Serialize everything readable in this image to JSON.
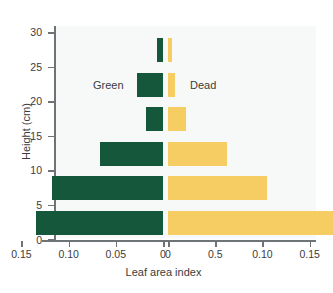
{
  "chart_data": {
    "type": "bar",
    "orientation": "horizontal",
    "layout": "back-to-back population pyramid",
    "title": "",
    "xlabel": "Leaf area index",
    "ylabel": "Height (cm)",
    "categories": [
      "0-5",
      "5-10",
      "10-15",
      "15-20",
      "20-25",
      "25-30"
    ],
    "band_centers": [
      2.5,
      7.5,
      12.5,
      17.5,
      22.5,
      27.5
    ],
    "ylim": [
      0,
      31
    ],
    "ytick_labels": [
      "0",
      "5",
      "10",
      "15",
      "20",
      "25",
      "30"
    ],
    "ytick_values": [
      0,
      5,
      10,
      15,
      20,
      25,
      30
    ],
    "left_axis": {
      "name": "Green",
      "direction": "reversed",
      "range": [
        0.15,
        0
      ],
      "tick_labels": [
        "0.15",
        "0.10",
        "0.05",
        "0"
      ],
      "tick_values": [
        0.15,
        0.1,
        0.05,
        0
      ]
    },
    "right_axis": {
      "name": "Dead",
      "direction": "normal",
      "range": [
        0,
        0.175
      ],
      "tick_labels": [
        "0",
        "0.5",
        "0.10",
        "0.15"
      ],
      "tick_values": [
        0,
        0.05,
        0.1,
        0.15
      ]
    },
    "grid": false,
    "legend_position": "inside-upper-center",
    "series": [
      {
        "name": "Green",
        "color": "#14573a",
        "side": "left",
        "values": [
          0.135,
          0.118,
          0.0665,
          0.018,
          0,
          0.006
        ]
      },
      {
        "name": "Dead",
        "color": "#f5cd62",
        "side": "right",
        "values": [
          0.175,
          0.105,
          0.063,
          0.019,
          0,
          0.004
        ]
      }
    ]
  },
  "axes": {
    "x_title": "Leaf area index",
    "y_title": "Height (cm)",
    "y_ticks": [
      "30",
      "25",
      "20",
      "15",
      "10",
      "5",
      "0"
    ],
    "x_ticks_left": [
      "0.15",
      "0.10",
      "0.05",
      "0"
    ],
    "x_ticks_right": [
      "0",
      "0.5",
      "0.10",
      "0.15"
    ]
  },
  "legend": {
    "green_label": "Green",
    "dead_label": "Dead",
    "green_color": "#14573a",
    "dead_color": "#f5cd62"
  }
}
